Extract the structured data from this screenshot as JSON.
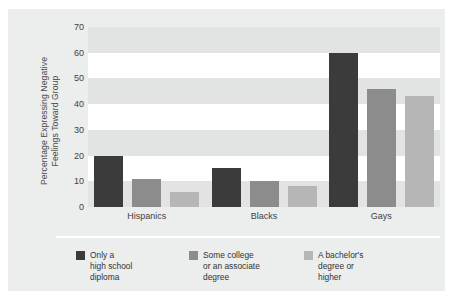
{
  "chart_data": {
    "type": "bar",
    "title": "",
    "xlabel": "",
    "ylabel": "Percentage Expressing Negative Feelings Toward Group",
    "ylabel_line1": "Percentage Expressing Negative",
    "ylabel_line2": "Feelings Toward Group",
    "categories": [
      "Hispanics",
      "Blacks",
      "Gays"
    ],
    "ylim": [
      0,
      70
    ],
    "yticks": [
      0,
      10,
      20,
      30,
      40,
      50,
      60,
      70
    ],
    "grid": "horizontal-bands",
    "legend_position": "bottom-left",
    "series": [
      {
        "name": "Only a high school diploma",
        "name_line1": "Only a",
        "name_line2": "high school",
        "name_line3": "diploma",
        "color": "#3b3b3b",
        "values": [
          20,
          15,
          60
        ]
      },
      {
        "name": "Some college or an associate degree",
        "name_line1": "Some college",
        "name_line2": "or an associate",
        "name_line3": "degree",
        "color": "#8c8c8c",
        "values": [
          11,
          10,
          46
        ]
      },
      {
        "name": "A bachelor's degree or higher",
        "name_line1": "A bachelor's",
        "name_line2": "degree or",
        "name_line3": "higher",
        "color": "#b6b6b6",
        "values": [
          6,
          8,
          43
        ]
      }
    ]
  },
  "colors": {
    "panel_background": "#eceded",
    "plot_background": "#ffffff",
    "band": "#e2e3e3",
    "text": "#3f3f3f",
    "divider": "#ffffff"
  }
}
